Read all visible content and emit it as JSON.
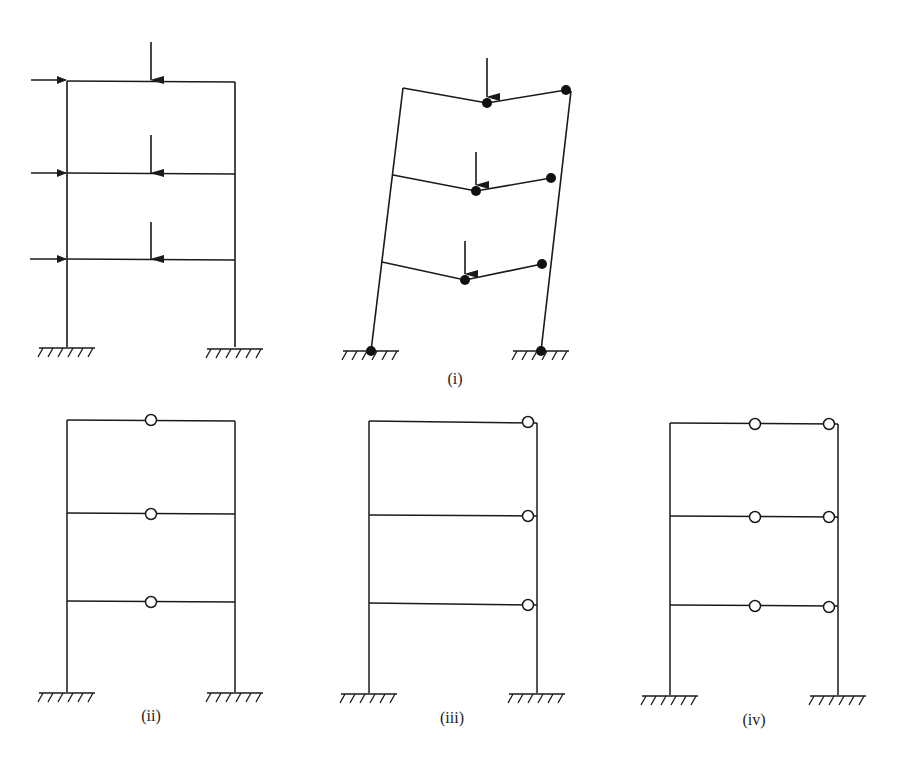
{
  "diagram": {
    "type": "structural-frame-collapse-mechanisms",
    "panels": [
      {
        "id": "loading",
        "label": "",
        "description": "Three-storey portal frame with fixed bases, horizontal point loads at each floor on left column and vertical point loads at mid-span of each beam"
      },
      {
        "id": "i",
        "label": "(i)",
        "description": "Combined sway and beam mechanism with plastic hinges (filled dots) at beam mid-spans, right beam ends and column bases"
      },
      {
        "id": "ii",
        "label": "(ii)",
        "description": "Beam mechanism: hinges at mid-span of each beam"
      },
      {
        "id": "iii",
        "label": "(iii)",
        "description": "Hinges at right end of each beam"
      },
      {
        "id": "iv",
        "label": "(iv)",
        "description": "Hinges at mid-span and right end of each beam"
      }
    ],
    "colors": {
      "line": "#1a1a1a",
      "background": "#ffffff",
      "hinge_open_fill": "#ffffff",
      "hinge_filled": "#111111"
    }
  }
}
